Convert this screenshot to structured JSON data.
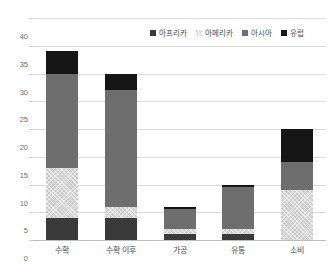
{
  "chart_data": {
    "type": "bar",
    "stacked": true,
    "title": "",
    "subtitle": "",
    "xlabel": "",
    "ylabel": "",
    "ylim": [
      0,
      40
    ],
    "yticks": [
      0,
      5,
      10,
      15,
      20,
      25,
      30,
      35,
      40
    ],
    "ytick_labels": [
      "0",
      "5",
      "10",
      "15",
      "20",
      "25",
      "30",
      "35",
      "40"
    ],
    "grid": true,
    "legend_position": "top-right",
    "categories": [
      "수확",
      "수확 이후",
      "가공",
      "유통",
      "소비"
    ],
    "series": [
      {
        "name": "아프리카",
        "key": "africa",
        "color": "#3a3a3a",
        "values": [
          4,
          4,
          1,
          1,
          0
        ]
      },
      {
        "name": "아메리카",
        "key": "america",
        "color": "#c9c9c9",
        "values": [
          9,
          2,
          1,
          1,
          9
        ]
      },
      {
        "name": "아시아",
        "key": "asia",
        "color": "#6e6e6e",
        "values": [
          17,
          21,
          3.5,
          7.5,
          5
        ]
      },
      {
        "name": "유럽",
        "key": "europe",
        "color": "#161616",
        "values": [
          4,
          3,
          0.5,
          0.5,
          6
        ]
      }
    ],
    "totals": [
      34,
      30,
      6,
      10,
      20
    ]
  },
  "legend": {
    "items": [
      {
        "label": "아프리카",
        "key": "africa"
      },
      {
        "label": "아메리카",
        "key": "america"
      },
      {
        "label": "아시아",
        "key": "asia"
      },
      {
        "label": "유럽",
        "key": "europe"
      }
    ]
  }
}
